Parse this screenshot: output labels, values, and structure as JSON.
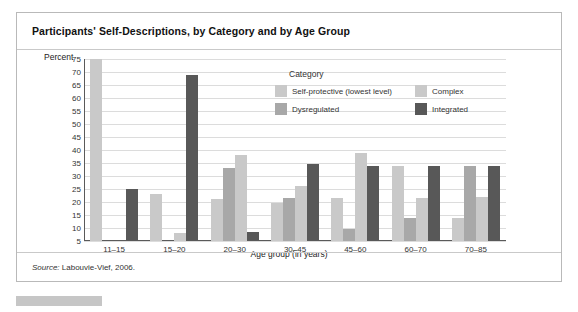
{
  "figure": {
    "title": "Participants' Self-Descriptions, by Category and by Age Group",
    "source_prefix": "Source:",
    "source_text": " Labouvie-Vief, 2006."
  },
  "legend": {
    "title": "Category",
    "items": [
      {
        "label": "Self-protective (lowest level)",
        "color": "#c9c9c9"
      },
      {
        "label": "Complex",
        "color": "#c9c9c9"
      },
      {
        "label": "Dysregulated",
        "color": "#a8a8a8"
      },
      {
        "label": "Integrated",
        "color": "#585858"
      }
    ]
  },
  "chart_data": {
    "type": "bar",
    "title": "Participants' Self-Descriptions, by Category and by Age Group",
    "xlabel": "Age group (in years)",
    "ylabel": "Percent",
    "ylim": [
      5,
      75
    ],
    "yticks": [
      75,
      70,
      65,
      60,
      55,
      50,
      45,
      40,
      35,
      30,
      25,
      20,
      15,
      10,
      5
    ],
    "grid": true,
    "legend_position": "inside-top-center",
    "categories": [
      "11–15",
      "15–20",
      "20–30",
      "30–45",
      "45–60",
      "60–70",
      "70–85"
    ],
    "series": [
      {
        "name": "Self-protective (lowest level)",
        "color": "#c9c9c9",
        "values": [
          75,
          23,
          21,
          19.5,
          21.5,
          34,
          14
        ]
      },
      {
        "name": "Dysregulated",
        "color": "#a8a8a8",
        "values": [
          null,
          null,
          33,
          21.5,
          9.5,
          14,
          34
        ]
      },
      {
        "name": "Integrated",
        "color": "#585858",
        "values": [
          null,
          8,
          38,
          26,
          39,
          21.5,
          22
        ]
      },
      {
        "name": "Complex",
        "color": "#c9c9c9",
        "values": [
          25,
          69,
          8.5,
          34.5,
          34,
          34,
          34
        ]
      }
    ]
  }
}
